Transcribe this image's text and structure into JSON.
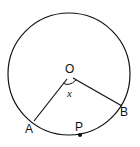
{
  "diagram": {
    "type": "circle-geometry",
    "labels": {
      "center": "O",
      "point_a": "A",
      "point_b": "B",
      "point_p": "P",
      "angle": "x"
    },
    "colors": {
      "stroke": "#111111",
      "background": "#ffffff"
    }
  }
}
